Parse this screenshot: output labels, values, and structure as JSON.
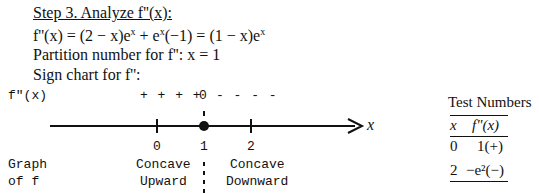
{
  "heading": "Step 3.  Analyze  f''(x):",
  "derivation": {
    "lhs": "f''(x) = (2 − x)e",
    "exp1": "x",
    "mid": " + e",
    "exp2": "x",
    "mid2": "(−1) = (1 − x)e",
    "exp3": "x"
  },
  "partition_line": "Partition number for  f'':  x = 1",
  "sign_chart_title": "Sign chart for  f'':",
  "sign_chart": {
    "row_label": "f\"(x)",
    "signs_left": "+ + + +",
    "zero": "0",
    "signs_right": "- - - -",
    "axis_variable": "x",
    "ticks": [
      "0",
      "1",
      "2"
    ],
    "critical_point": "1",
    "graph_label_line1": "Graph",
    "graph_label_line2": "of f",
    "left_region_line1": "Concave",
    "left_region_line2": "Upward",
    "right_region_line1": "Concave",
    "right_region_line2": "Downward"
  },
  "test_numbers": {
    "title": "Test Numbers",
    "headers": [
      "x",
      "f\"(x)"
    ],
    "rows": [
      {
        "x": "0",
        "value": "1(+)"
      },
      {
        "x": "2",
        "value": "−e²(−)"
      }
    ]
  }
}
